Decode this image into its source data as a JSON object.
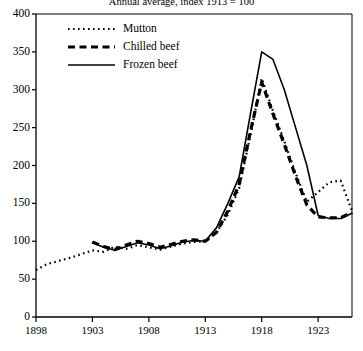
{
  "chart_data": {
    "type": "line",
    "title": "Annual average, index 1913 = 100",
    "xlabel": "",
    "ylabel": "",
    "xlim": [
      1898,
      1926
    ],
    "ylim": [
      0,
      400
    ],
    "ytick_step": 50,
    "xtick_step": 5,
    "grid": false,
    "legend_position": "top-left",
    "yticks": [
      "0",
      "50",
      "100",
      "150",
      "200",
      "250",
      "300",
      "350",
      "400"
    ],
    "xticks": [
      "1898",
      "1903",
      "1908",
      "1913",
      "1918",
      "1923"
    ],
    "series": [
      {
        "name": "Mutton",
        "style": "dotted",
        "x": [
          1898,
          1899,
          1900,
          1901,
          1902,
          1903,
          1904,
          1905,
          1906,
          1907,
          1908,
          1909,
          1910,
          1911,
          1912,
          1913,
          1914,
          1915,
          1916,
          1917,
          1918,
          1919,
          1920,
          1921,
          1922,
          1923,
          1924,
          1925,
          1926
        ],
        "values": [
          62,
          70,
          74,
          78,
          83,
          88,
          86,
          93,
          90,
          95,
          92,
          89,
          93,
          97,
          99,
          100,
          112,
          135,
          170,
          240,
          315,
          272,
          232,
          190,
          152,
          165,
          178,
          180,
          140
        ]
      },
      {
        "name": "Chilled beef",
        "style": "dashed",
        "x": [
          1903,
          1904,
          1905,
          1906,
          1907,
          1908,
          1909,
          1910,
          1911,
          1912,
          1913,
          1914,
          1915,
          1916,
          1917,
          1918,
          1919,
          1920,
          1921,
          1922,
          1923,
          1924,
          1925,
          1926
        ],
        "values": [
          99,
          93,
          89,
          95,
          100,
          97,
          92,
          96,
          100,
          102,
          100,
          112,
          140,
          175,
          245,
          310,
          268,
          228,
          186,
          148,
          132,
          131,
          131,
          138
        ]
      },
      {
        "name": "Frozen beef",
        "style": "solid",
        "x": [
          1903,
          1904,
          1905,
          1906,
          1907,
          1908,
          1909,
          1910,
          1911,
          1912,
          1913,
          1914,
          1915,
          1916,
          1917,
          1918,
          1919,
          1920,
          1921,
          1922,
          1923,
          1924,
          1925,
          1926
        ],
        "values": [
          98,
          92,
          88,
          93,
          98,
          95,
          90,
          94,
          99,
          101,
          100,
          118,
          150,
          185,
          268,
          350,
          340,
          300,
          250,
          200,
          134,
          130,
          130,
          137
        ]
      }
    ]
  },
  "legend": {
    "items": [
      {
        "label": "Mutton"
      },
      {
        "label": "Chilled beef"
      },
      {
        "label": "Frozen beef"
      }
    ]
  }
}
